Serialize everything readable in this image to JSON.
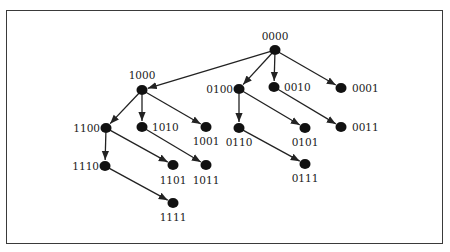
{
  "diagram": {
    "type": "hypercube-spanning-tree",
    "colors": {
      "node": "#111111",
      "edge": "#222222",
      "frame": "#3a3a3a",
      "background": "#ffffff"
    },
    "nodes": [
      {
        "id": "0000",
        "label": "0000",
        "x": 275,
        "y": 50,
        "lx": 275,
        "ly": 40,
        "anchor": "middle"
      },
      {
        "id": "1000",
        "label": "1000",
        "x": 142,
        "y": 90,
        "lx": 142,
        "ly": 79,
        "anchor": "middle"
      },
      {
        "id": "0100",
        "label": "0100",
        "x": 239,
        "y": 89,
        "lx": 233,
        "ly": 93,
        "anchor": "end"
      },
      {
        "id": "0010",
        "label": "0010",
        "x": 274,
        "y": 87,
        "lx": 284,
        "ly": 91,
        "anchor": "start"
      },
      {
        "id": "0001",
        "label": "0001",
        "x": 341,
        "y": 88,
        "lx": 352,
        "ly": 92,
        "anchor": "start"
      },
      {
        "id": "1100",
        "label": "1100",
        "x": 106,
        "y": 128,
        "lx": 100,
        "ly": 132,
        "anchor": "end"
      },
      {
        "id": "1010",
        "label": "1010",
        "x": 142,
        "y": 127,
        "lx": 152,
        "ly": 131,
        "anchor": "start"
      },
      {
        "id": "1001",
        "label": "1001",
        "x": 206,
        "y": 127,
        "lx": 206,
        "ly": 145,
        "anchor": "middle"
      },
      {
        "id": "0110",
        "label": "0110",
        "x": 239,
        "y": 128,
        "lx": 239,
        "ly": 146,
        "anchor": "middle"
      },
      {
        "id": "0101",
        "label": "0101",
        "x": 305,
        "y": 128,
        "lx": 305,
        "ly": 146,
        "anchor": "middle"
      },
      {
        "id": "0011",
        "label": "0011",
        "x": 341,
        "y": 127,
        "lx": 352,
        "ly": 131,
        "anchor": "start"
      },
      {
        "id": "1110",
        "label": "1110",
        "x": 105,
        "y": 166,
        "lx": 99,
        "ly": 170,
        "anchor": "end"
      },
      {
        "id": "1101",
        "label": "1101",
        "x": 173,
        "y": 165,
        "lx": 173,
        "ly": 184,
        "anchor": "middle"
      },
      {
        "id": "1011",
        "label": "1011",
        "x": 206,
        "y": 165,
        "lx": 206,
        "ly": 184,
        "anchor": "middle"
      },
      {
        "id": "0111",
        "label": "0111",
        "x": 305,
        "y": 164,
        "lx": 305,
        "ly": 182,
        "anchor": "middle"
      },
      {
        "id": "1111",
        "label": "1111",
        "x": 173,
        "y": 203,
        "lx": 173,
        "ly": 221,
        "anchor": "middle"
      }
    ],
    "edges": [
      [
        "0000",
        "1000"
      ],
      [
        "0000",
        "0100"
      ],
      [
        "0000",
        "0010"
      ],
      [
        "0000",
        "0001"
      ],
      [
        "1000",
        "1100"
      ],
      [
        "1000",
        "1010"
      ],
      [
        "1000",
        "1001"
      ],
      [
        "0100",
        "0110"
      ],
      [
        "0100",
        "0101"
      ],
      [
        "0010",
        "0011"
      ],
      [
        "1100",
        "1110"
      ],
      [
        "1100",
        "1101"
      ],
      [
        "1010",
        "1011"
      ],
      [
        "0110",
        "0111"
      ],
      [
        "1110",
        "1111"
      ]
    ]
  }
}
